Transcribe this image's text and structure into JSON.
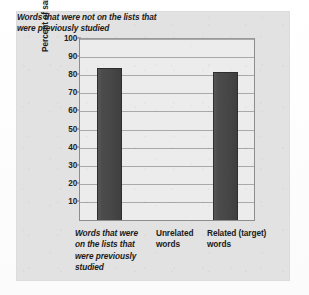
{
  "chart_data": {
    "type": "bar",
    "title": "",
    "subtitle": "",
    "xlabel": "",
    "ylabel": "Percent of sample recalling each type of word",
    "ylim": [
      0,
      100
    ],
    "ytick_step": 10,
    "yticks": [
      "100",
      "90",
      "80",
      "70",
      "60",
      "50",
      "40",
      "30",
      "20",
      "10"
    ],
    "grid": true,
    "legend": null,
    "categories": [
      "Words that were on the lists that were previously studied",
      "Unrelated words",
      "Related (target) words"
    ],
    "values": [
      84,
      0,
      82
    ],
    "bars": [
      {
        "category": "Words that were on the lists that were previously studied",
        "value": 84,
        "has_bar": true
      },
      {
        "category": "Unrelated words",
        "value": 0,
        "has_bar": false
      },
      {
        "category": "Related (target) words",
        "value": 82,
        "has_bar": true
      }
    ],
    "annotations": [
      "Words that were not on the lists that were previously studied"
    ],
    "colors": {
      "bar_fill": "#474747",
      "bar_edge": "#2e2e2e",
      "plot_background": "#ececec",
      "card_background": "#e2e2e2",
      "grid": "#9e9e9e",
      "text": "#1b1b1b"
    }
  },
  "axis": {
    "y_title": "Percent of sample recalling each type of word",
    "ticks": [
      {
        "label": "100",
        "value": 100
      },
      {
        "label": "90",
        "value": 90
      },
      {
        "label": "80",
        "value": 80
      },
      {
        "label": "70",
        "value": 70
      },
      {
        "label": "60",
        "value": 60
      },
      {
        "label": "50",
        "value": 50
      },
      {
        "label": "40",
        "value": 40
      },
      {
        "label": "30",
        "value": 30
      },
      {
        "label": "20",
        "value": 20
      },
      {
        "label": "10",
        "value": 10
      }
    ]
  },
  "x_labels": {
    "studied": "Words that were on the lists that were previously studied",
    "unrelated": "Unrelated words",
    "related": "Related (target) words",
    "group_caption": "Words that were not on the lists that were previously studied"
  }
}
